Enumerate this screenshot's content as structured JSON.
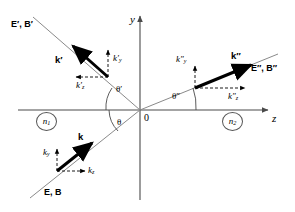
{
  "figure": {
    "type": "optics-ray-diagram",
    "background": "#ffffff",
    "line_color": "#6b6b6b",
    "vector_color": "#000000"
  },
  "axes": {
    "y_label": "y",
    "z_label": "z",
    "origin_label": "0"
  },
  "media": {
    "left": "n",
    "left_sub": "1",
    "right": "n",
    "right_sub": "2"
  },
  "angles": {
    "incident": "θ",
    "reflected": "θ′",
    "transmitted": "θ″",
    "incident_deg": 45,
    "reflected_deg": 45,
    "transmitted_deg": 20
  },
  "waves": {
    "incident": {
      "k_label": "k",
      "ky_label": "k",
      "ky_sub": "y",
      "kz_label": "k",
      "kz_sub": "z",
      "field_label": "E, B"
    },
    "reflected": {
      "k_label": "k′",
      "ky_label": "k′",
      "ky_sub": "y",
      "kz_label": "k′",
      "kz_sub": "z",
      "field_label": "E′, B′"
    },
    "transmitted": {
      "k_label": "k″",
      "ky_label": "k″",
      "ky_sub": "y",
      "kz_label": "k″",
      "kz_sub": "z",
      "field_label": "E″, B″"
    }
  }
}
